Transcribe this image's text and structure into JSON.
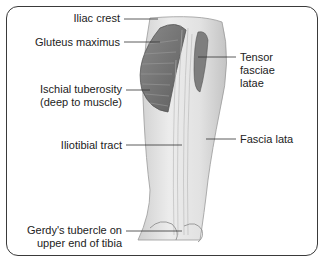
{
  "diagram": {
    "labels": {
      "iliac_crest": "Iliac crest",
      "gluteus_maximus": "Gluteus maximus",
      "ischial_tuberosity_line1": "Ischial tuberosity",
      "ischial_tuberosity_line2": "(deep to muscle)",
      "iliotibial_tract": "Iliotibial tract",
      "gerdys_line1": "Gerdy's tubercle on",
      "gerdys_line2": "upper end of tibia",
      "tensor_line1": "Tensor",
      "tensor_line2": "fasciae",
      "tensor_line3": "latae",
      "fascia_lata": "Fascia lata"
    },
    "colors": {
      "border": "#3a3a3a",
      "leader_line": "#333333",
      "muscle_dark": "#6e6e6e",
      "skin": "#e6e6e6",
      "text": "#222222"
    }
  }
}
